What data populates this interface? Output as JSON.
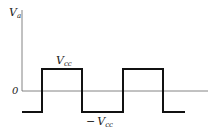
{
  "diagram": {
    "type": "square-wave",
    "y_axis_label": "V",
    "y_axis_label_sub": "a",
    "zero_label": "0",
    "high_label": "V",
    "high_label_sub": "cc",
    "low_label_prefix": "−",
    "low_label": "V",
    "low_label_sub": "cc",
    "colors": {
      "axis": "#555555",
      "waveform": "#111111",
      "text": "#222222"
    },
    "waveform_points": [
      [
        22,
        112
      ],
      [
        42,
        112
      ],
      [
        42,
        69
      ],
      [
        82,
        69
      ],
      [
        82,
        112
      ],
      [
        123,
        112
      ],
      [
        123,
        69
      ],
      [
        163,
        69
      ],
      [
        163,
        112
      ],
      [
        185,
        112
      ]
    ]
  }
}
